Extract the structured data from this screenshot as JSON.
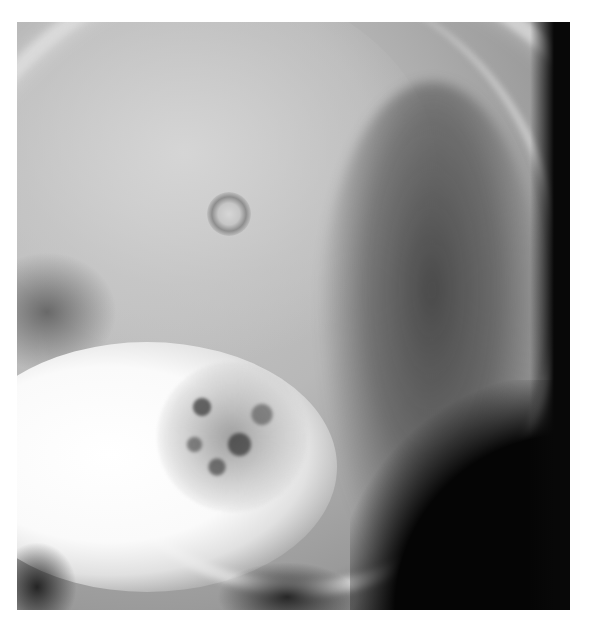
{
  "image": {
    "subject": "Lateral skull radiograph",
    "description": "Grayscale X-ray showing the posterior skull vault, mastoid air cells and dense petrous bone",
    "colors": {
      "background": "#ffffff",
      "film_dark": "#0a0a0a",
      "bone_bright": "#ffffff",
      "soft_gray": "#b8b8b8"
    }
  }
}
